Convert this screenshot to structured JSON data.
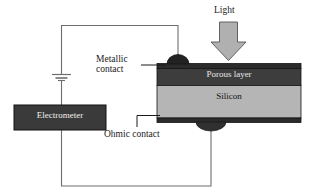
{
  "diagram": {
    "labels": {
      "light": "Light",
      "metallic_contact_line1": "Metallic",
      "metallic_contact_line2": "contact",
      "ohmic_contact": "Ohmic contact",
      "porous_layer": "Porous layer",
      "silicon": "Silicon",
      "electrometer": "Electrometer"
    },
    "colors": {
      "background": "#ffffff",
      "porous_layer_fill": "#3d3d3d",
      "silicon_fill": "#b5b5b5",
      "contact_layer_fill": "#2b2b2b",
      "electrometer_fill": "#3a3a3a",
      "arrow_fill": "#b0b0b0",
      "wire": "#6e6e6e",
      "outline": "#1a1a1a",
      "label_text": "#1a1a1a"
    },
    "parts": {
      "light_arrow": "down-block-arrow",
      "metallic_contact_bump": "dome",
      "ohmic_contact_bump": "dome",
      "battery_symbol": "capacitor-battery",
      "circuit": "closed-loop"
    }
  }
}
